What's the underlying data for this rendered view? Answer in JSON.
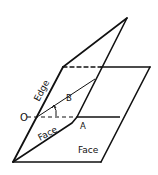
{
  "diagram": {
    "labels": {
      "edge": "Edge",
      "face_upper": "Face",
      "face_lower": "Face",
      "point_o": "O",
      "point_a": "A",
      "point_b": "B"
    },
    "colors": {
      "stroke": "#111111",
      "background": "#ffffff"
    }
  }
}
